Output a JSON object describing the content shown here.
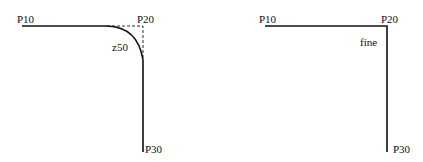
{
  "left_diagram": {
    "labels": {
      "start": "P10",
      "corner": "P20",
      "radius": "z50",
      "end": "P30"
    },
    "corner_type": "rounded (radius z50)"
  },
  "right_diagram": {
    "labels": {
      "start": "P10",
      "corner": "P20",
      "mode": "fine",
      "end": "P30"
    },
    "corner_type": "sharp (fine)"
  },
  "colors": {
    "line": "#111111",
    "background": "#ffffff"
  }
}
